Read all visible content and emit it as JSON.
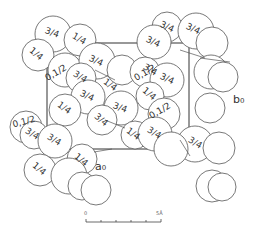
{
  "diagram": {
    "type": "crystal-structure-projection",
    "axes": {
      "a": "a₀",
      "b": "b₀"
    },
    "scale_bar": {
      "start": "0",
      "end": "5Å",
      "ticks": 5
    },
    "atom_labels": [
      {
        "text": "3/4",
        "x": 52,
        "y": 33,
        "rot": 20
      },
      {
        "text": "1/4",
        "x": 79,
        "y": 39,
        "rot": 30
      },
      {
        "text": "1/4",
        "x": 36,
        "y": 54,
        "rot": 40
      },
      {
        "text": "3/4",
        "x": 96,
        "y": 61,
        "rot": 25
      },
      {
        "text": "0,1/2",
        "x": 56,
        "y": 73,
        "rot": -30
      },
      {
        "text": "3/4",
        "x": 80,
        "y": 77,
        "rot": 30
      },
      {
        "text": "1/4",
        "x": 110,
        "y": 85,
        "rot": 35
      },
      {
        "text": "3/4",
        "x": 87,
        "y": 96,
        "rot": 25
      },
      {
        "text": "1/4",
        "x": 64,
        "y": 108,
        "rot": 35
      },
      {
        "text": "3/4",
        "x": 120,
        "y": 108,
        "rot": 20
      },
      {
        "text": "3/4",
        "x": 101,
        "y": 120,
        "rot": 40
      },
      {
        "text": "1/4",
        "x": 133,
        "y": 134,
        "rot": 35
      },
      {
        "text": "3/4",
        "x": 167,
        "y": 27,
        "rot": 25
      },
      {
        "text": "3/4",
        "x": 193,
        "y": 29,
        "rot": 25
      },
      {
        "text": "3/4",
        "x": 153,
        "y": 42,
        "rot": 25
      },
      {
        "text": "0,1/2",
        "x": 145,
        "y": 73,
        "rot": -30
      },
      {
        "text": "3/4",
        "x": 150,
        "y": 70,
        "rot": 30
      },
      {
        "text": "3/4",
        "x": 167,
        "y": 79,
        "rot": 25
      },
      {
        "text": "1/4",
        "x": 149,
        "y": 94,
        "rot": 40
      },
      {
        "text": "0,1/2",
        "x": 160,
        "y": 111,
        "rot": -30
      },
      {
        "text": "3/4",
        "x": 154,
        "y": 133,
        "rot": 30
      },
      {
        "text": "3/4",
        "x": 195,
        "y": 143,
        "rot": 30
      },
      {
        "text": "0,1/2",
        "x": 24,
        "y": 122,
        "rot": -15
      },
      {
        "text": "3/4",
        "x": 32,
        "y": 134,
        "rot": 30
      },
      {
        "text": "3/4",
        "x": 54,
        "y": 140,
        "rot": 30
      },
      {
        "text": "1/4",
        "x": 39,
        "y": 169,
        "rot": 40
      },
      {
        "text": "1/4",
        "x": 81,
        "y": 160,
        "rot": 40
      }
    ]
  }
}
